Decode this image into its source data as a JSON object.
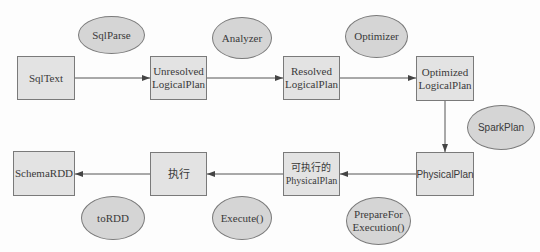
{
  "nodes": {
    "sqltext": "SqlText",
    "unresolved": "Unresolved\nLogicalPlan",
    "resolved": "Resolved\nLogicalPlan",
    "optimized": "Optimized\nLogicalPlan",
    "physical": "PhysicalPlan",
    "executable": "可执行的\nPhysicalPlan",
    "execute": "执行",
    "schemardd": "SchemaRDD"
  },
  "steps": {
    "sqlparse": "SqlParse",
    "analyzer": "Analyzer",
    "optimizer": "Optimizer",
    "sparkplan": "SparkPlan",
    "prepare": "PrepareFor\nExecution()",
    "execute_fn": "Execute()",
    "tordd": "toRDD"
  },
  "colors": {
    "box_fill": "#e3e3e3",
    "ellipse_fill": "#d5d5d5",
    "stroke": "#7a7a7a",
    "edge": "#555555"
  }
}
